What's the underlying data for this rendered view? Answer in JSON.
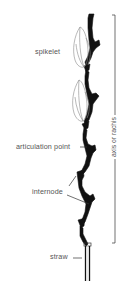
{
  "diagram": {
    "labels": {
      "spikelet": "spikelet",
      "articulation_point": "articulation point",
      "internode": "internode",
      "straw": "straw",
      "axis": "axis or rachis"
    },
    "colors": {
      "stem": "#111111",
      "spikelet_outline": "#888888",
      "label_text": "#555555",
      "leader_line": "#333333",
      "background": "#ffffff"
    }
  }
}
